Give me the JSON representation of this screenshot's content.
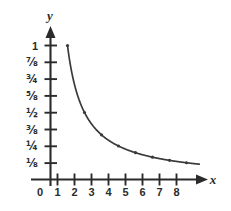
{
  "chart_data": {
    "type": "line",
    "title": "",
    "subtitle": "",
    "xlabel": "x",
    "ylabel": "y",
    "function_label": "y = 1/x",
    "x": [
      1,
      2,
      3,
      4,
      5,
      6,
      7,
      8
    ],
    "values": [
      1,
      0.5,
      0.3333333333,
      0.25,
      0.2,
      0.1666666667,
      0.1428571429,
      0.125
    ],
    "value_labels": [
      "1",
      "1/2",
      "1/3",
      "1/4",
      "1/5",
      "1/6",
      "1/7",
      "1/8"
    ],
    "series": [
      {
        "name": "y = 1/x",
        "values": [
          1,
          0.5,
          0.3333333333,
          0.25,
          0.2,
          0.1666666667,
          0.1428571429,
          0.125
        ]
      }
    ],
    "xlim": [
      0,
      9.2
    ],
    "ylim": [
      0,
      1.12
    ],
    "grid": false,
    "legend": false,
    "legend_position": "none",
    "markers": true,
    "origin_label": "0",
    "x_ticks": [
      {
        "value": 1,
        "label": "1"
      },
      {
        "value": 2,
        "label": "2"
      },
      {
        "value": 3,
        "label": "3"
      },
      {
        "value": 4,
        "label": "4"
      },
      {
        "value": 5,
        "label": "5"
      },
      {
        "value": 6,
        "label": "6"
      },
      {
        "value": 7,
        "label": "7"
      },
      {
        "value": 8,
        "label": "8"
      }
    ],
    "y_ticks": [
      {
        "value": 1,
        "label": "1"
      },
      {
        "value": 0.875,
        "label": "⅞"
      },
      {
        "value": 0.75,
        "label": "¾"
      },
      {
        "value": 0.625,
        "label": "⅝"
      },
      {
        "value": 0.5,
        "label": "½"
      },
      {
        "value": 0.375,
        "label": "⅜"
      },
      {
        "value": 0.25,
        "label": "¼"
      },
      {
        "value": 0.125,
        "label": "⅛"
      }
    ],
    "colors": {
      "curve": "#3a3a3a",
      "axis": "#2b2b2b",
      "text": "#2b2b2b",
      "background": "#ffffff"
    }
  }
}
